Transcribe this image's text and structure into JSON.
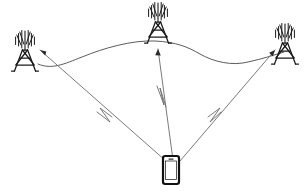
{
  "diagram": {
    "title": "Mobile device connected to three cellular towers",
    "background_color": "#ffffff",
    "width": 306,
    "height": 194,
    "colors": {
      "tower_stroke": "#1a1a1a",
      "link_stroke": "#4a4a4a",
      "signal_stroke": "#6b6b6b",
      "arrow_fill": "#2b2b2b",
      "phone_stroke": "#111111",
      "phone_screen": "#ffffff"
    },
    "towers": [
      {
        "id": "tower-left",
        "label": "left-cell-tower",
        "x": 25,
        "y": 55,
        "scale": 1.0
      },
      {
        "id": "tower-center",
        "label": "center-cell-tower",
        "x": 158,
        "y": 27,
        "scale": 1.0
      },
      {
        "id": "tower-right",
        "label": "right-cell-tower",
        "x": 285,
        "y": 48,
        "scale": 1.0
      }
    ],
    "device": {
      "id": "mobile-phone",
      "label": "mobile-phone",
      "x": 171,
      "y": 170,
      "width": 16,
      "height": 28
    },
    "backhaul_link": {
      "label": "tower-to-tower-curved-link",
      "path": "M 38 64 C 52 70 64 64 82 57 C 104 48 132 40 155 41 C 176 42 188 47 200 54 C 214 62 232 66 248 62 C 262 59 274 55 284 52"
    },
    "signal_links": [
      {
        "id": "link-left",
        "label": "signal-phone-to-left-tower",
        "from": "mobile-phone",
        "to": "tower-left",
        "path": "M 166 161 L 40 50",
        "bolt_path": "M 112 117 L 100 108 L 110 122 L 97 112",
        "arrow_at": [
          40,
          50
        ],
        "arrow_angle": 221
      },
      {
        "id": "link-center",
        "label": "signal-phone-to-center-tower",
        "from": "mobile-phone",
        "to": "tower-center",
        "path": "M 173 160 L 158 49",
        "bolt_path": "M 166 107 L 160 88 L 164 105 L 157 86",
        "arrow_at": [
          158,
          49
        ],
        "arrow_angle": 277
      },
      {
        "id": "link-right",
        "label": "signal-phone-to-right-tower",
        "from": "mobile-phone",
        "to": "tower-right",
        "path": "M 180 161 L 275 50",
        "bolt_path": "M 221 112 L 210 122 L 220 108 L 208 117",
        "arrow_at": [
          275,
          50
        ],
        "arrow_angle": 310
      }
    ]
  }
}
